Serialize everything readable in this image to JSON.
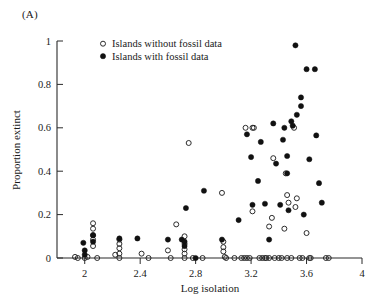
{
  "panel": {
    "label": "(A)"
  },
  "chart_data": {
    "type": "scatter",
    "title": "",
    "xlabel": "Log isolation",
    "ylabel": "Proportion extinct",
    "xlim": [
      1.8,
      4.0
    ],
    "ylim": [
      0.0,
      1.0
    ],
    "xticks": [
      2,
      2.4,
      2.8,
      3.2,
      3.6,
      4
    ],
    "xticklabels": [
      "2",
      "2.4",
      "2.8",
      "3.2",
      "3.6",
      "4"
    ],
    "yticks": [
      0,
      0.2,
      0.4,
      0.6,
      0.8,
      1
    ],
    "yticklabels": [
      "0",
      "0.2",
      "0.4",
      "0.6",
      "0.8",
      "1"
    ],
    "grid": false,
    "legend_position": "upper-center",
    "marker_colors": {
      "open": "#222222",
      "filled": "#111111"
    },
    "series": [
      {
        "name": "Islands without fossil data",
        "marker": "open-circle",
        "points": [
          [
            1.93,
            0.005
          ],
          [
            1.95,
            0.0
          ],
          [
            2.0,
            0.0
          ],
          [
            2.02,
            0.005
          ],
          [
            2.06,
            0.16
          ],
          [
            2.06,
            0.135
          ],
          [
            2.06,
            0.105
          ],
          [
            2.06,
            0.085
          ],
          [
            2.06,
            0.055
          ],
          [
            2.09,
            0.0
          ],
          [
            2.22,
            0.015
          ],
          [
            2.25,
            0.085
          ],
          [
            2.25,
            0.065
          ],
          [
            2.25,
            0.045
          ],
          [
            2.25,
            0.02
          ],
          [
            2.25,
            0.0
          ],
          [
            2.41,
            0.02
          ],
          [
            2.46,
            0.0
          ],
          [
            2.6,
            0.035
          ],
          [
            2.62,
            0.0
          ],
          [
            2.66,
            0.155
          ],
          [
            2.72,
            0.1
          ],
          [
            2.72,
            0.065
          ],
          [
            2.72,
            0.04
          ],
          [
            2.72,
            0.02
          ],
          [
            2.72,
            0.0
          ],
          [
            2.75,
            0.53
          ],
          [
            2.78,
            0.0
          ],
          [
            2.85,
            0.0
          ],
          [
            2.99,
            0.3
          ],
          [
            3.0,
            0.075
          ],
          [
            3.0,
            0.05
          ],
          [
            3.0,
            0.03
          ],
          [
            3.01,
            0.005
          ],
          [
            3.02,
            0.0
          ],
          [
            3.08,
            0.0
          ],
          [
            3.13,
            0.0
          ],
          [
            3.15,
            0.0
          ],
          [
            3.17,
            0.0
          ],
          [
            3.19,
            0.0
          ],
          [
            3.21,
            0.215
          ],
          [
            3.22,
            0.6
          ],
          [
            3.26,
            0.0
          ],
          [
            3.28,
            0.0
          ],
          [
            3.3,
            0.0
          ],
          [
            3.31,
            0.0
          ],
          [
            3.33,
            0.0
          ],
          [
            3.35,
            0.185
          ],
          [
            3.36,
            0.46
          ],
          [
            3.37,
            0.0
          ],
          [
            3.4,
            0.0
          ],
          [
            3.42,
            0.0
          ],
          [
            3.44,
            0.135
          ],
          [
            3.45,
            0.39
          ],
          [
            3.46,
            0.29
          ],
          [
            3.46,
            0.0
          ],
          [
            3.49,
            0.0
          ],
          [
            3.51,
            0.6
          ],
          [
            3.52,
            0.235
          ],
          [
            3.53,
            0.275
          ],
          [
            3.55,
            0.0
          ],
          [
            3.57,
            0.0
          ],
          [
            3.6,
            0.115
          ],
          [
            3.62,
            0.0
          ],
          [
            3.63,
            0.0
          ],
          [
            3.74,
            0.0
          ],
          [
            3.76,
            0.0
          ],
          [
            3.21,
            0.6
          ],
          [
            3.16,
            0.6
          ],
          [
            3.47,
            0.255
          ],
          [
            3.33,
            0.145
          ]
        ]
      },
      {
        "name": "Islands with fossil data",
        "marker": "filled-circle",
        "points": [
          [
            1.99,
            0.07
          ],
          [
            2.0,
            0.035
          ],
          [
            2.0,
            0.015
          ],
          [
            2.06,
            0.105
          ],
          [
            2.06,
            0.075
          ],
          [
            2.25,
            0.09
          ],
          [
            2.38,
            0.09
          ],
          [
            2.6,
            0.085
          ],
          [
            2.7,
            0.085
          ],
          [
            2.72,
            0.075
          ],
          [
            2.72,
            0.055
          ],
          [
            2.73,
            0.23
          ],
          [
            2.8,
            0.0
          ],
          [
            2.86,
            0.31
          ],
          [
            2.99,
            0.085
          ],
          [
            3.11,
            0.175
          ],
          [
            3.17,
            0.57
          ],
          [
            3.2,
            0.465
          ],
          [
            3.25,
            0.355
          ],
          [
            3.27,
            0.535
          ],
          [
            3.3,
            0.25
          ],
          [
            3.33,
            0.085
          ],
          [
            3.36,
            0.62
          ],
          [
            3.38,
            0.435
          ],
          [
            3.41,
            0.245
          ],
          [
            3.43,
            0.545
          ],
          [
            3.44,
            0.6
          ],
          [
            3.46,
            0.39
          ],
          [
            3.47,
            0.22
          ],
          [
            3.49,
            0.63
          ],
          [
            3.5,
            0.61
          ],
          [
            3.52,
            0.98
          ],
          [
            3.53,
            0.66
          ],
          [
            3.56,
            0.74
          ],
          [
            3.56,
            0.7
          ],
          [
            3.58,
            0.2
          ],
          [
            3.6,
            0.87
          ],
          [
            3.62,
            0.455
          ],
          [
            3.66,
            0.87
          ],
          [
            3.67,
            0.565
          ],
          [
            3.69,
            0.345
          ],
          [
            3.71,
            0.255
          ],
          [
            3.46,
            0.47
          ],
          [
            3.21,
            0.245
          ]
        ]
      }
    ],
    "legend": [
      {
        "marker": "open-circle",
        "label": "Islands without fossil data"
      },
      {
        "marker": "filled-circle",
        "label": "Islands with fossil data"
      }
    ]
  }
}
